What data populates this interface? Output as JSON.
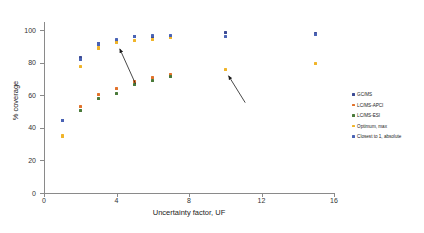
{
  "chart_data": {
    "type": "scatter",
    "title": "",
    "xlabel": "Uncertainty factor, UF",
    "ylabel": "% coverage",
    "xlim": [
      0,
      16
    ],
    "ylim": [
      0,
      105
    ],
    "xticks": [
      0,
      4,
      8,
      12,
      16
    ],
    "yticks": [
      0,
      20,
      40,
      60,
      80,
      100
    ],
    "grid": false,
    "legend_position": "right",
    "x": [
      1,
      2,
      3,
      4,
      5,
      6,
      7,
      10,
      15
    ],
    "series": [
      {
        "name": "GC/MS",
        "color": "#3b4a94",
        "values": [
          44.5,
          83.0,
          91.5,
          93.5,
          96.0,
          96.0,
          96.0,
          98.5,
          98.0
        ]
      },
      {
        "name": "LC/MS-APCI",
        "color": "#e2722a",
        "values": [
          null,
          53.0,
          60.5,
          64.0,
          68.5,
          71.0,
          72.5,
          null,
          null
        ]
      },
      {
        "name": "LC/MS-ESI",
        "color": "#4a7a3a",
        "values": [
          null,
          50.5,
          58.0,
          61.0,
          66.5,
          69.0,
          71.5,
          null,
          null
        ]
      },
      {
        "name": "Optimum, max",
        "color": "#f0b429",
        "values": [
          35.0,
          77.5,
          89.0,
          92.5,
          93.5,
          94.5,
          95.5,
          76.0,
          79.5
        ]
      },
      {
        "name": "Closest to 1, absolute",
        "color": "#4a63b5",
        "values": [
          44.5,
          82.0,
          91.5,
          94.5,
          96.0,
          96.5,
          96.5,
          96.0,
          97.5
        ]
      }
    ],
    "annotations": [
      {
        "name": "arrow-upper",
        "from_x": 5.05,
        "from_y": 67.0,
        "to_x": 4.18,
        "to_y": 88.5
      },
      {
        "name": "arrow-lower",
        "from_x": 11.1,
        "from_y": 55.5,
        "to_x": 10.18,
        "to_y": 72.0
      }
    ]
  },
  "legend": {
    "items": [
      {
        "label": "GC/MS",
        "color": "#3b4a94"
      },
      {
        "label": "LC/MS-APCI",
        "color": "#e2722a"
      },
      {
        "label": "LC/MS-ESI",
        "color": "#4a7a3a"
      },
      {
        "label": "Optimum, max",
        "color": "#f0b429"
      },
      {
        "label": "Closest to 1, absolute",
        "color": "#4a63b5"
      }
    ]
  }
}
